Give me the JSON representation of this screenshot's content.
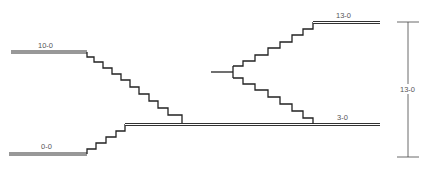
{
  "diagram": {
    "type": "stepped-level-section",
    "levels": [
      {
        "id": "level-10",
        "label": "10-0"
      },
      {
        "id": "level-0",
        "label": "0-0"
      },
      {
        "id": "level-3",
        "label": "3-0"
      },
      {
        "id": "level-13",
        "label": "13-0"
      }
    ],
    "dimension": {
      "label": "13-0"
    },
    "colors": {
      "line": "#222222",
      "background": "#ffffff",
      "label": "#555555"
    }
  }
}
